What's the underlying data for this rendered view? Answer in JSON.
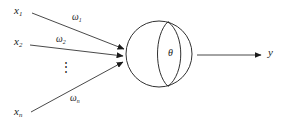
{
  "diagram": {
    "background_color": "#ffffff",
    "stroke_color": "#1a1a1a",
    "inputs": [
      {
        "id": "x1",
        "base": "x",
        "subscript": "1",
        "text": "x₁",
        "x": 14,
        "y": 5
      },
      {
        "id": "x2",
        "base": "x",
        "subscript": "2",
        "text": "x₂",
        "x": 14,
        "y": 36
      },
      {
        "id": "xn",
        "base": "x",
        "subscript": "n",
        "text": "xₙ",
        "x": 14,
        "y": 106
      }
    ],
    "weights": [
      {
        "id": "w1",
        "base": "ω",
        "subscript": "1",
        "text": "ω₁",
        "x": 72,
        "y": 13
      },
      {
        "id": "w2",
        "base": "ω",
        "subscript": "2",
        "text": "ω₂",
        "x": 56,
        "y": 35
      },
      {
        "id": "wn",
        "base": "ω",
        "subscript": "n",
        "text": "ωₙ",
        "x": 70,
        "y": 94
      }
    ],
    "ellipsis": {
      "text": "⋮",
      "x": 60,
      "y": 61
    },
    "threshold": {
      "text": "θ",
      "x": 168,
      "y": 48
    },
    "output": {
      "text": "y",
      "x": 268,
      "y": 47
    },
    "soma": {
      "cx": 159,
      "cy": 54,
      "r": 33
    },
    "output_arrow": {
      "x1": 197,
      "y1": 55,
      "x2": 261,
      "y2": 55
    }
  }
}
